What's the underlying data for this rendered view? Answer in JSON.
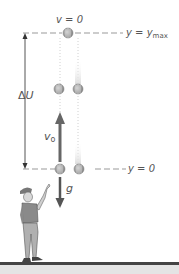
{
  "diagram": {
    "labels": {
      "top_velocity": "v = 0",
      "y_max_prefix": "y = y",
      "y_max_subscript": "max",
      "y_zero": "y = 0",
      "delta_u_prefix": "Δ",
      "delta_u_letter": "U",
      "v0_letter": "v",
      "v0_subscript": "o",
      "gravity": "g"
    },
    "colors": {
      "line": "#999999",
      "arrow_dark": "#555555",
      "ball": "#9a9a9a",
      "text": "#555555",
      "ground": "#444444"
    },
    "icons": {
      "ball": "ball-icon",
      "person": "person-icon",
      "arrow_up": "velocity-arrow-up-icon",
      "arrow_down": "gravity-arrow-down-icon"
    }
  }
}
